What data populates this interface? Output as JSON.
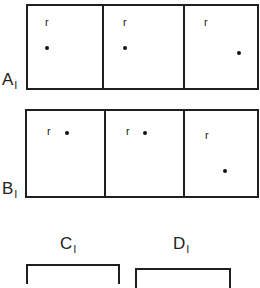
{
  "rows": [
    {
      "label": "A",
      "subscript": "I",
      "cells": [
        {
          "marker": "r",
          "marker_pos": [
            17,
            13
          ],
          "dot_pos": [
            17,
            39
          ]
        },
        {
          "marker": "r",
          "marker_pos": [
            17,
            13
          ],
          "dot_pos": [
            18,
            39
          ]
        },
        {
          "marker": "r",
          "marker_pos": [
            17,
            13
          ],
          "dot_pos": [
            51,
            46
          ]
        }
      ]
    },
    {
      "label": "B",
      "subscript": "I",
      "cells": [
        {
          "marker": "r",
          "marker_pos": [
            17,
            15
          ],
          "dot_pos": [
            37,
            18
          ]
        },
        {
          "marker": "r",
          "marker_pos": [
            17,
            15
          ],
          "dot_pos": [
            37,
            18
          ]
        },
        {
          "marker": "r",
          "marker_pos": [
            17,
            18
          ],
          "dot_pos": [
            35,
            57
          ]
        }
      ]
    }
  ],
  "columns": [
    {
      "label": "C",
      "subscript": "I"
    },
    {
      "label": "D",
      "subscript": "I"
    }
  ],
  "colors": {
    "line": "#1f1f1f",
    "background": "#ffffff"
  }
}
